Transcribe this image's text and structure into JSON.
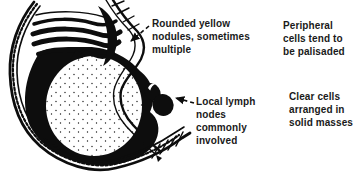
{
  "figure": {
    "kind": "black-and-white medical illustration of a stomach cross-section with a large pale rounded nodule and an adjacent lymph node",
    "ink_color": "#0d0d0d",
    "text_color": "#1a1a1a",
    "background_color": "#ffffff",
    "labels": {
      "nodules": "Rounded yellow\nnodules, sometimes\nmultiple",
      "lymph": "Local lymph\nnodes\ncommonly\ninvolved",
      "peripheral": "Peripheral\ncells tend to\nbe palisaded",
      "clear_cells": "Clear cells\narranged in\nsolid masses"
    },
    "icons": {
      "lymph_node": "lymph-node-icon",
      "leader_arrow": "dashed-arrow-icon",
      "internal_pointer": "solid-arrow-icon"
    }
  }
}
